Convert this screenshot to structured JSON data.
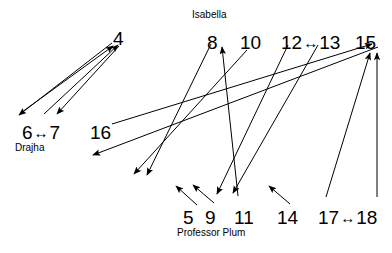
{
  "diagram": {
    "title": "",
    "background_color": "#ffffff",
    "stroke_color": "#000000",
    "nodes": [
      {
        "id": "n4",
        "label": "4",
        "x": 113,
        "y": 29
      },
      {
        "id": "n8",
        "label": "8",
        "x": 207,
        "y": 33
      },
      {
        "id": "n10",
        "label": "10",
        "x": 240,
        "y": 33
      },
      {
        "id": "n12",
        "label": "12",
        "x": 281,
        "y": 33
      },
      {
        "id": "n13",
        "label": "13",
        "x": 310,
        "y": 33
      },
      {
        "id": "n15",
        "label": "15",
        "x": 355,
        "y": 33
      },
      {
        "id": "n6",
        "label": "6",
        "x": 22,
        "y": 123
      },
      {
        "id": "n7",
        "label": "7",
        "x": 51,
        "y": 123
      },
      {
        "id": "n16",
        "label": "16",
        "x": 90,
        "y": 123
      },
      {
        "id": "n5",
        "label": "5",
        "x": 183,
        "y": 208
      },
      {
        "id": "n9",
        "label": "9",
        "x": 205,
        "y": 208
      },
      {
        "id": "n11",
        "label": "11",
        "x": 234,
        "y": 208
      },
      {
        "id": "n14",
        "label": "14",
        "x": 277,
        "y": 208
      },
      {
        "id": "n17",
        "label": "17",
        "x": 318,
        "y": 208
      },
      {
        "id": "n18",
        "label": "18",
        "x": 352,
        "y": 208
      }
    ],
    "person_labels": [
      {
        "id": "isabella",
        "text": "Isabella",
        "x": 192,
        "y": 10
      },
      {
        "id": "drajha",
        "text": "Drajha",
        "x": 15,
        "y": 143
      },
      {
        "id": "plum",
        "text": "Professor Plum",
        "x": 177,
        "y": 228
      }
    ],
    "bidirectional_pairs": [
      {
        "id": "pair-6-7",
        "left": "6",
        "right": "7",
        "glyph": "↔"
      },
      {
        "id": "pair-12-13",
        "left": "12",
        "right": "13",
        "glyph": "↔"
      },
      {
        "id": "pair-17-18",
        "left": "17",
        "right": "18",
        "glyph": "↔"
      }
    ],
    "edges": [
      {
        "id": "e1",
        "from": "6",
        "to": "4",
        "x1": 22,
        "y1": 112,
        "x2": 113,
        "y2": 46,
        "head": "end"
      },
      {
        "id": "e2",
        "from": "7",
        "to": "4",
        "x1": 44,
        "y1": 114,
        "x2": 118,
        "y2": 45,
        "head": "end"
      },
      {
        "id": "e3",
        "from": "4",
        "to": "6",
        "x1": 112,
        "y1": 43,
        "x2": 19,
        "y2": 115,
        "head": "end"
      },
      {
        "id": "e4",
        "from": "4",
        "to": "7",
        "x1": 119,
        "y1": 46,
        "x2": 57,
        "y2": 114,
        "head": "end"
      },
      {
        "id": "e5",
        "from": "16",
        "to": "15",
        "x1": 112,
        "y1": 124,
        "x2": 372,
        "y2": 44,
        "head": "end"
      },
      {
        "id": "e6",
        "from": "15",
        "to": "16a",
        "x1": 378,
        "y1": 47,
        "x2": 93,
        "y2": 155,
        "head": "end"
      },
      {
        "id": "e7",
        "from": "10",
        "to": "16b",
        "x1": 247,
        "y1": 50,
        "x2": 134,
        "y2": 174,
        "head": "end"
      },
      {
        "id": "e8",
        "from": "8",
        "to": "9",
        "x1": 211,
        "y1": 44,
        "x2": 147,
        "y2": 175,
        "head": "end"
      },
      {
        "id": "e9",
        "from": "11",
        "to": "10",
        "x1": 238,
        "y1": 196,
        "x2": 222,
        "y2": 47,
        "head": "end"
      },
      {
        "id": "e10",
        "from": "12",
        "to": "9",
        "x1": 288,
        "y1": 45,
        "x2": 217,
        "y2": 194,
        "head": "end"
      },
      {
        "id": "e11",
        "from": "13",
        "to": "11",
        "x1": 318,
        "y1": 45,
        "x2": 233,
        "y2": 193,
        "head": "end"
      },
      {
        "id": "e12",
        "from": "17",
        "to": "15",
        "x1": 326,
        "y1": 197,
        "x2": 370,
        "y2": 53,
        "head": "end"
      },
      {
        "id": "e13",
        "from": "18",
        "to": "15",
        "x1": 377,
        "y1": 197,
        "x2": 377,
        "y2": 53,
        "head": "end"
      },
      {
        "id": "e14",
        "from": "5s",
        "to": "5",
        "x1": 197,
        "y1": 205,
        "x2": 176,
        "y2": 186,
        "head": "end"
      },
      {
        "id": "e15",
        "from": "9s",
        "to": "9",
        "x1": 214,
        "y1": 203,
        "x2": 193,
        "y2": 185,
        "head": "end"
      },
      {
        "id": "e16",
        "from": "14s",
        "to": "14",
        "x1": 290,
        "y1": 204,
        "x2": 269,
        "y2": 186,
        "head": "end"
      }
    ]
  }
}
